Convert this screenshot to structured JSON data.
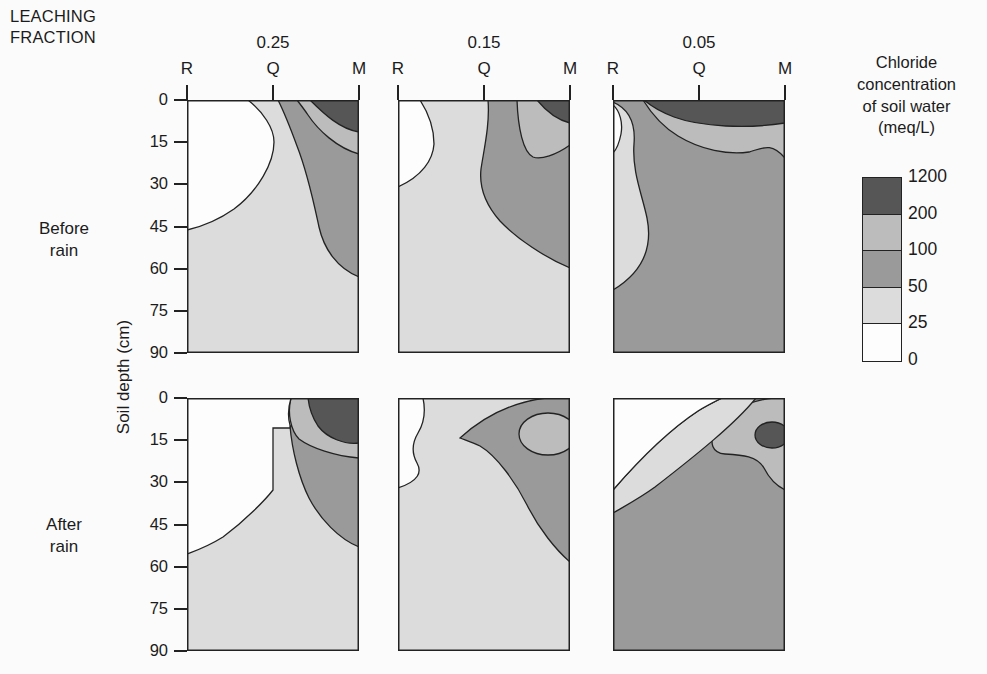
{
  "figure_title": {
    "line1": "LEACHING",
    "line2": "FRACTION"
  },
  "column_headers": [
    "0.25",
    "0.15",
    "0.05"
  ],
  "x_labels": [
    "R",
    "Q",
    "M"
  ],
  "row_labels": [
    {
      "line1": "Before",
      "line2": "rain"
    },
    {
      "line1": "After",
      "line2": "rain"
    }
  ],
  "y_axis": {
    "label": "Soil depth (cm)",
    "ticks": [
      "0",
      "15",
      "30",
      "45",
      "60",
      "75",
      "90"
    ]
  },
  "legend": {
    "title_lines": [
      "Chloride",
      "concentration",
      "of soil water",
      "(meq/L)"
    ],
    "tick_labels": [
      "1200",
      "200",
      "100",
      "50",
      "25",
      "0"
    ],
    "cell_colors": [
      "#565656",
      "#bcbcbc",
      "#9a9a9a",
      "#dcdcdc",
      "#fdfdfd"
    ],
    "band_colors": {
      "0-25": "#fdfdfd",
      "25-50": "#dcdcdc",
      "50-100": "#9a9a9a",
      "100-200": "#bcbcbc",
      "200-1200": "#565656"
    }
  },
  "chart_data": {
    "type": "heatmap",
    "subtype": "filled-contour-cross-sections",
    "title": "LEACHING FRACTION",
    "legend_title": "Chloride concentration of soil water (meq/L)",
    "contour_levels_meq_per_L": [
      0,
      25,
      50,
      100,
      200,
      1200
    ],
    "x_categories": [
      "R",
      "Q",
      "M"
    ],
    "y_axis": {
      "label": "Soil depth (cm)",
      "range": [
        0,
        90
      ],
      "ticks": [
        0,
        15,
        30,
        45,
        60,
        75,
        90
      ]
    },
    "columns_leaching_fraction": [
      0.25,
      0.15,
      0.05
    ],
    "rows": [
      "Before rain",
      "After rain"
    ],
    "panels": [
      {
        "row": "Before rain",
        "leaching_fraction": 0.25,
        "bands": "White (<25) lobe from surface near Q down-left to ~47 cm at R; 25-50 fills remaining lower profile; 50-100 band sweeps from surface right of Q down the M side to ~63 cm; thin 100-200 band and dark >200 zone confined to top-right corner (0-15 cm at M)."
      },
      {
        "row": "Before rain",
        "leaching_fraction": 0.15,
        "bands": "Small white (<25) lobe at top-left to ~31 cm at R; 25-50 over lower profile; large 50-100 region from surface near Q spreading right and down to ~60 cm at M; 100-200 band to ~16 cm and >200 corner at top right."
      },
      {
        "row": "Before rain",
        "leaching_fraction": 0.05,
        "bands": ">200 dark band across whole surface (~0-9 cm); 100-200 band beneath it to ~18 cm; 50-100 occupies most of the profile to 90 cm; wavy 25-50 strip along R edge to ~67 cm; tiny white sliver at top of R edge."
      },
      {
        "row": "After rain",
        "leaching_fraction": 0.25,
        "bands": "Large white (<25) zone from surface to ~55 cm at R with step at Q (~11 cm); 25-50 over rest of lower profile; >200 pocket at top-right (0-16 cm) ringed by 100-200; 50-100 along M side to ~53 cm."
      },
      {
        "row": "After rain",
        "leaching_fraction": 0.15,
        "bands": "Small white pocket on R edge (0-32 cm); 25-50 over most of profile; 50-100 plume in upper right from ~14 cm tip near Q down M side to ~58 cm, enclosing a 100-200 core at ~5-20 cm near M."
      },
      {
        "row": "After rain",
        "leaching_fraction": 0.05,
        "bands": "White wedge at top-left to ~33 cm on R edge; 25-50 diagonal band beneath it; 50-100 over most of profile to 90 cm; 100-200 hook near top of M side (to ~33 cm) with dark >200 core at ~9-18 cm."
      }
    ]
  }
}
